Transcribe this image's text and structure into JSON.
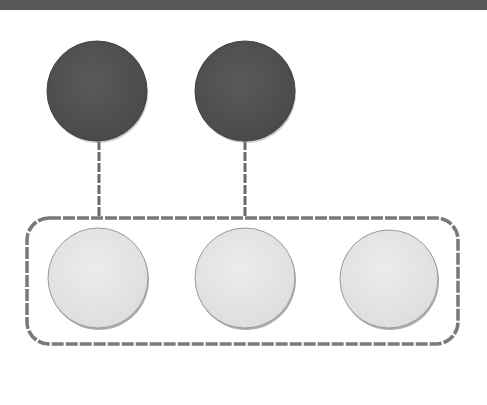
{
  "header": {
    "bar_color": "#575757"
  },
  "diagram": {
    "parents": [
      {
        "id": "parent-1",
        "cx": 97,
        "cy": 91,
        "r": 50,
        "fill": "#545454"
      },
      {
        "id": "parent-2",
        "cx": 245,
        "cy": 91,
        "r": 50,
        "fill": "#545454"
      }
    ],
    "group": {
      "x": 27,
      "y": 218,
      "width": 431,
      "height": 126,
      "rx": 22,
      "stroke": "#7a7a7a"
    },
    "children": [
      {
        "id": "child-1",
        "cx": 98,
        "cy": 278,
        "r": 50,
        "fill": "#e6e6e6"
      },
      {
        "id": "child-2",
        "cx": 245,
        "cy": 278,
        "r": 50,
        "fill": "#e6e6e6"
      },
      {
        "id": "child-3",
        "cx": 389,
        "cy": 279,
        "r": 49,
        "fill": "#e6e6e6"
      }
    ],
    "connectors": [
      {
        "x": 99,
        "y1": 141,
        "y2": 218
      },
      {
        "x": 245,
        "y1": 141,
        "y2": 218
      }
    ]
  }
}
